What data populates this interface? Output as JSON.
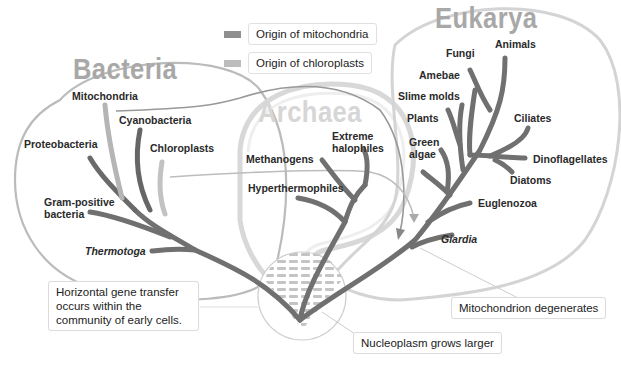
{
  "legend": [
    {
      "label": "Origin of mitochondria",
      "color": "#8f8f8f"
    },
    {
      "label": "Origin of chloroplasts",
      "color": "#bdbdbd"
    }
  ],
  "domains": {
    "bacteria": "Bacteria",
    "archaea": "Archaea",
    "eukarya": "Eukarya"
  },
  "bacteria_labels": {
    "mitochondria": "Mitochondria",
    "cyanobacteria": "Cyanobacteria",
    "proteobacteria": "Proteobacteria",
    "chloroplasts": "Chloroplasts",
    "gram_positive_1": "Gram-positive",
    "gram_positive_2": "bacteria",
    "thermotoga": "Thermotoga"
  },
  "archaea_labels": {
    "extreme_1": "Extreme",
    "extreme_2": "halophiles",
    "methanogens": "Methanogens",
    "hyperthermophiles": "Hyperthermophiles"
  },
  "eukarya_labels": {
    "fungi": "Fungi",
    "animals": "Animals",
    "amebae": "Amebae",
    "slime_molds": "Slime molds",
    "plants": "Plants",
    "green_1": "Green",
    "green_2": "algae",
    "ciliates": "Ciliates",
    "dinoflagellates": "Dinoflagellates",
    "diatoms": "Diatoms",
    "euglenozoa": "Euglenozoa",
    "giardia": "Giardia"
  },
  "callouts": {
    "hgt_1": "Horizontal gene transfer",
    "hgt_2": "occurs within the",
    "hgt_3": "community of early cells.",
    "mito_degenerates": "Mitochondrion degenerates",
    "nucleoplasm": "Nucleoplasm grows larger"
  },
  "colors": {
    "branch": "#6f6f6f",
    "branch_light": "#b9b9b9",
    "outline": "#c8c8c8"
  }
}
